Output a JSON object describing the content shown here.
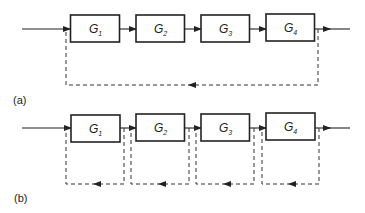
{
  "diagram": {
    "type": "block-diagram",
    "colors": {
      "line": "#222222",
      "background": "#ffffff"
    },
    "panels": [
      {
        "label": "(a)",
        "blocks": [
          {
            "symbol": "G",
            "subscript": "1"
          },
          {
            "symbol": "G",
            "subscript": "2"
          },
          {
            "symbol": "G",
            "subscript": "3"
          },
          {
            "symbol": "G",
            "subscript": "4"
          }
        ],
        "feedback": "single dashed loop from output of G4 back to input of G1"
      },
      {
        "label": "(b)",
        "blocks": [
          {
            "symbol": "G",
            "subscript": "1"
          },
          {
            "symbol": "G",
            "subscript": "2"
          },
          {
            "symbol": "G",
            "subscript": "3"
          },
          {
            "symbol": "G",
            "subscript": "4"
          }
        ],
        "feedback": "separate dashed loop around each block"
      }
    ]
  }
}
